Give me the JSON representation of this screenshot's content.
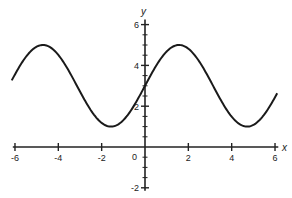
{
  "chart_data": {
    "type": "line",
    "title": "",
    "xlabel": "x",
    "ylabel": "y",
    "xlim": [
      -6.2,
      6.2
    ],
    "ylim": [
      -2.2,
      6.3
    ],
    "x_ticks": [
      -6,
      -4,
      -2,
      2,
      4,
      6
    ],
    "x_tick_labels": [
      "-6",
      "-4",
      "-2",
      "2",
      "4",
      "6"
    ],
    "y_ticks": [
      -2,
      2,
      4,
      6
    ],
    "y_tick_labels": [
      "-2",
      "2",
      "4",
      "6"
    ],
    "origin_label": "0",
    "y_minor_step": 0.5,
    "grid": false,
    "legend": null,
    "series": [
      {
        "name": "y = 3 + 2 sin(x)",
        "function": "3 + 2*sin(x)",
        "x": [
          -6.0,
          -4.71,
          -3.14,
          -1.57,
          0,
          1.57,
          3.14,
          4.71,
          6.0
        ],
        "values": [
          3.56,
          5.0,
          3.0,
          1.0,
          3.0,
          5.0,
          3.0,
          1.0,
          2.44
        ]
      }
    ],
    "line_color": "#1a1a1a"
  }
}
